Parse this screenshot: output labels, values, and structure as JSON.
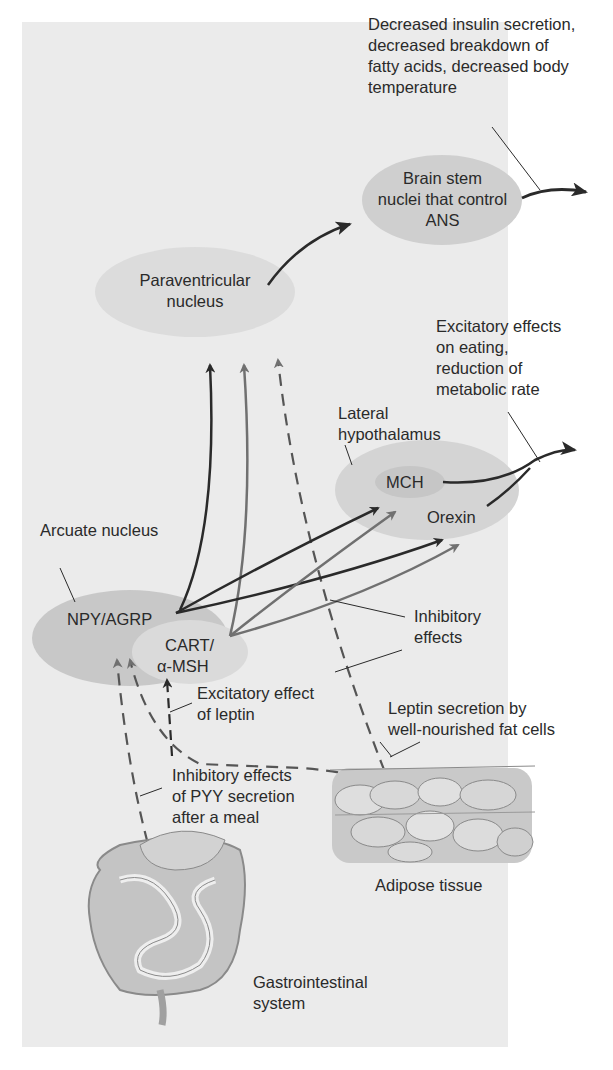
{
  "diagram": {
    "background_color": "#ebebeb",
    "ellipse_color": "#cfcfcf",
    "inner_ellipse_color": "#dcdcdc",
    "excitatory_arrow_color": "#2a2a2a",
    "inhibitory_arrow_color": "#707070",
    "nodes": {
      "brain_stem": {
        "line1": "Brain stem",
        "line2": "nuclei that control",
        "line3": "ANS"
      },
      "paraventricular": {
        "line1": "Paraventricular",
        "line2": "nucleus"
      },
      "lateral_hypothalamus": {
        "label_line1": "Lateral",
        "label_line2": "hypothalamus",
        "mch": "MCH",
        "orexin": "Orexin"
      },
      "arcuate": {
        "label": "Arcuate nucleus",
        "npy_agrp": "NPY/AGRP",
        "cart_line1": "CART/",
        "cart_line2": "α-MSH"
      },
      "adipose": {
        "label": "Adipose tissue"
      },
      "gi": {
        "line1": "Gastrointestinal",
        "line2": "system"
      }
    },
    "annotations": {
      "ans_effects": {
        "line1": "Decreased insulin secretion,",
        "line2": "decreased breakdown of",
        "line3": "fatty acids, decreased body",
        "line4": "temperature"
      },
      "lh_effects": {
        "line1": "Excitatory effects",
        "line2": "on eating,",
        "line3": "reduction of",
        "line4": "metabolic rate"
      },
      "inhibitory": {
        "line1": "Inhibitory",
        "line2": "effects"
      },
      "excitatory_leptin": {
        "line1": "Excitatory effect",
        "line2": "of leptin"
      },
      "leptin_secretion": {
        "line1": "Leptin secretion by",
        "line2": "well-nourished fat cells"
      },
      "pyy": {
        "line1": "Inhibitory effects",
        "line2": "of PYY secretion",
        "line3": "after a meal"
      }
    }
  }
}
